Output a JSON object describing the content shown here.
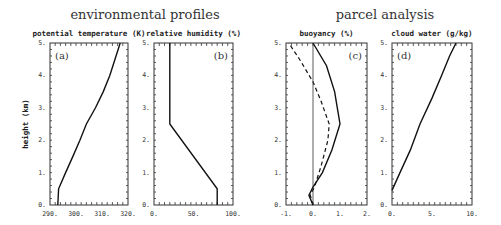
{
  "titles": {
    "left": "environmental profiles",
    "right": "parcel analysis"
  },
  "y_axis_label": "height (km)",
  "chart_data": [
    {
      "type": "line",
      "panel": "(a)",
      "title": "potential temperature (K)",
      "xlabel": "potential temperature (K)",
      "ylabel": "height (km)",
      "xlim": [
        290,
        320
      ],
      "ylim": [
        0,
        5
      ],
      "xticks": [
        "290.",
        "300.",
        "310.",
        "320."
      ],
      "yticks": [
        "0.",
        "1.",
        "2.",
        "3.",
        "4.",
        "5."
      ],
      "series": [
        {
          "name": "theta",
          "style": "solid",
          "points": [
            [
              293,
              0
            ],
            [
              293.3,
              0.5
            ],
            [
              296,
              1.0
            ],
            [
              298.8,
              1.5
            ],
            [
              301.5,
              2.0
            ],
            [
              304,
              2.5
            ],
            [
              307.5,
              3.0
            ],
            [
              310.5,
              3.5
            ],
            [
              313,
              4.0
            ],
            [
              315,
              4.5
            ],
            [
              317,
              5.0
            ]
          ]
        }
      ]
    },
    {
      "type": "line",
      "panel": "(b)",
      "title": "relative humidity (%)",
      "xlabel": "relative humidity (%)",
      "ylabel": "height (km)",
      "xlim": [
        0,
        100
      ],
      "ylim": [
        0,
        5
      ],
      "xticks": [
        "0.",
        "50.",
        "100."
      ],
      "yticks": [
        "0.",
        "1.",
        "2.",
        "3.",
        "4.",
        "5."
      ],
      "series": [
        {
          "name": "RH",
          "style": "solid",
          "points": [
            [
              80,
              0
            ],
            [
              80,
              0.5
            ],
            [
              20,
              2.5
            ],
            [
              20,
              5.0
            ]
          ]
        }
      ]
    },
    {
      "type": "line",
      "panel": "(c)",
      "title": "buoyancy (%)",
      "xlabel": "buoyancy (%)",
      "ylabel": "height (km)",
      "xlim": [
        -1,
        2
      ],
      "ylim": [
        0,
        5
      ],
      "xticks": [
        "-1.",
        "0.",
        "1.",
        "2."
      ],
      "yticks": [
        "0.",
        "1.",
        "2.",
        "3.",
        "4.",
        "5."
      ],
      "series": [
        {
          "name": "solid",
          "style": "solid",
          "points": [
            [
              0,
              0
            ],
            [
              -0.15,
              0.3
            ],
            [
              0,
              0.55
            ],
            [
              0.35,
              1.0
            ],
            [
              0.7,
              1.7
            ],
            [
              1.0,
              2.5
            ],
            [
              0.8,
              3.5
            ],
            [
              0.5,
              4.3
            ],
            [
              0,
              5.0
            ]
          ]
        },
        {
          "name": "dashed",
          "style": "dashed",
          "points": [
            [
              0,
              0
            ],
            [
              -0.1,
              0.3
            ],
            [
              0.05,
              0.55
            ],
            [
              0.3,
              1.2
            ],
            [
              0.55,
              2.0
            ],
            [
              0.6,
              2.5
            ],
            [
              0.3,
              3.2
            ],
            [
              0,
              3.8
            ],
            [
              -0.5,
              4.5
            ],
            [
              -0.9,
              5.0
            ]
          ]
        },
        {
          "name": "zero-line",
          "style": "thin",
          "points": [
            [
              0,
              0
            ],
            [
              0,
              5
            ]
          ]
        }
      ]
    },
    {
      "type": "line",
      "panel": "(d)",
      "title": "cloud water (g/kg)",
      "xlabel": "cloud water (g/kg)",
      "ylabel": "height (km)",
      "xlim": [
        0,
        10
      ],
      "ylim": [
        0,
        5
      ],
      "xticks": [
        "0.",
        "5.",
        "10."
      ],
      "yticks": [
        "0.",
        "1.",
        "2.",
        "3.",
        "4.",
        "5."
      ],
      "series": [
        {
          "name": "qc",
          "style": "solid",
          "points": [
            [
              0,
              0.45
            ],
            [
              1.0,
              1.0
            ],
            [
              2.3,
              1.7
            ],
            [
              3.5,
              2.5
            ],
            [
              5.0,
              3.3
            ],
            [
              6.2,
              4.0
            ],
            [
              7.2,
              4.6
            ],
            [
              8.0,
              5.0
            ]
          ]
        }
      ]
    }
  ]
}
